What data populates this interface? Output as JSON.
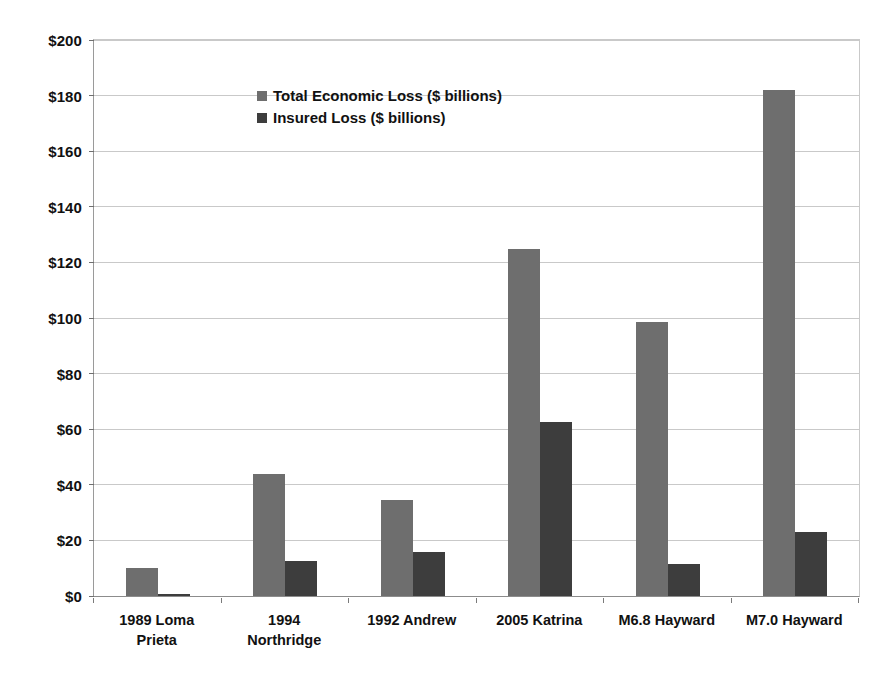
{
  "chart_data": {
    "type": "bar",
    "title": "",
    "subtitle": "",
    "xlabel": "",
    "ylabel": "",
    "ylim": [
      0,
      200
    ],
    "ytick_step": 20,
    "ytick_labels": [
      "$0",
      "$20",
      "$40",
      "$60",
      "$80",
      "$100",
      "$120",
      "$140",
      "$160",
      "$180",
      "$200"
    ],
    "ytick_values": [
      0,
      20,
      40,
      60,
      80,
      100,
      120,
      140,
      160,
      180,
      200
    ],
    "grid": true,
    "legend_position": "top-left inside plot",
    "categories": [
      "1989 Loma\nPrieta",
      "1994\nNorthridge",
      "1992 Andrew",
      "2005 Katrina",
      "M6.8 Hayward",
      "M7.0 Hayward"
    ],
    "series": [
      {
        "name": "Total Economic Loss ($ billions)",
        "color": "#6e6e6e",
        "values": [
          10,
          44,
          34.5,
          125,
          98.5,
          182
        ]
      },
      {
        "name": "Insured Loss ($ billions)",
        "color": "#3d3d3d",
        "values": [
          0.8,
          12.5,
          16,
          62.5,
          11.5,
          23
        ]
      }
    ]
  },
  "colors": {
    "total_series": "#6e6e6e",
    "insured_series": "#3d3d3d",
    "gridline": "#c9c9c9",
    "axis": "#8c8c8c",
    "text": "#111111",
    "background": "#ffffff"
  }
}
